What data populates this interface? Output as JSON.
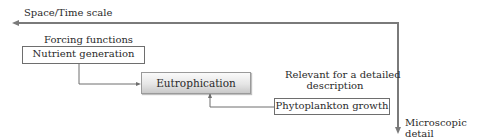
{
  "diagram": {
    "axes": {
      "horizontal_label": "Space/Time scale",
      "vertical_label_line1": "Microscopic",
      "vertical_label_line2": "detail"
    },
    "annotations": {
      "forcing_functions": "Forcing functions",
      "relevant_line1": "Relevant for a detailed",
      "relevant_line2": "description"
    },
    "nodes": [
      {
        "id": "nutrient",
        "label": "Nutrient generation"
      },
      {
        "id": "eutrophication",
        "label": "Eutrophication"
      },
      {
        "id": "phytoplankton",
        "label": "Phytoplankton growth"
      }
    ],
    "edges": [
      {
        "from": "nutrient",
        "to": "eutrophication"
      },
      {
        "from": "phytoplankton",
        "to": "eutrophication"
      }
    ],
    "colors": {
      "axis_line": "#7a7a7a",
      "connector": "#6e6e6e",
      "box_border": "#6e6e6e"
    }
  }
}
